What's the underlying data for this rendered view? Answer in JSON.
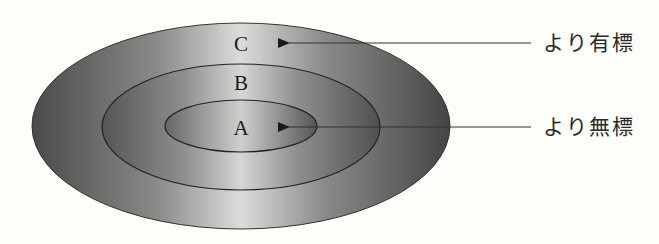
{
  "diagram": {
    "type": "concentric-ellipses",
    "regions": [
      {
        "id": "A",
        "label": "A",
        "level": "inner"
      },
      {
        "id": "B",
        "label": "B",
        "level": "middle"
      },
      {
        "id": "C",
        "label": "C",
        "level": "outer"
      }
    ],
    "annotations": [
      {
        "label": "より有標",
        "points_to": "C"
      },
      {
        "label": "より無標",
        "points_to": "A"
      }
    ],
    "colors": {
      "background": "#fdfdf9",
      "fill_dark": "#4a4a4a",
      "fill_light": "#d8d8d6",
      "stroke": "#222222"
    }
  }
}
